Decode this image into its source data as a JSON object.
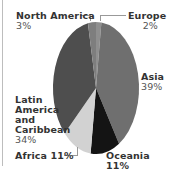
{
  "chart_data": {
    "type": "pie",
    "title": "",
    "categories": [
      "Europe",
      "Asia",
      "Oceania",
      "Africa",
      "Latin America and Caribbean",
      "North America"
    ],
    "values": [
      2,
      39,
      11,
      11,
      34,
      3
    ],
    "colors": [
      "#8f8f8f",
      "#6f6f6f",
      "#141414",
      "#d2d2d2",
      "#4e4e4e",
      "#7e7e7e"
    ],
    "legend": "none",
    "labels": [
      {
        "name": "Europe",
        "pct": "2%"
      },
      {
        "name": "Asia",
        "pct": "39%"
      },
      {
        "name": "Oceania",
        "pct": "11%"
      },
      {
        "name": "Africa",
        "pct": "11%"
      },
      {
        "name": "Latin America and Caribbean",
        "pct": "34%"
      },
      {
        "name": "North America",
        "pct": "3%"
      }
    ]
  },
  "labels": {
    "north_america": {
      "name": "North America",
      "pct": "3%"
    },
    "europe": {
      "name": "Europe",
      "pct": "2%"
    },
    "asia": {
      "name": "Asia",
      "pct": "39%"
    },
    "latin_line1": "Latin",
    "latin_line2": "America",
    "latin_line3": "and",
    "latin_line4": "Caribbean",
    "latin_pct": "34%",
    "africa": "Africa 11%",
    "oceania": "Oceania 11%"
  }
}
